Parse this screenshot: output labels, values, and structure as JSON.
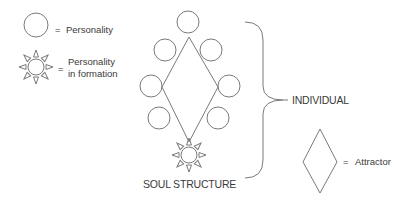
{
  "legend": {
    "personality": {
      "icon": "circle-icon",
      "equals": "=",
      "label": "Personality"
    },
    "personality_in_formation": {
      "icon": "sun-icon",
      "equals": "=",
      "label_line1": "Personality",
      "label_line2": "in formation"
    },
    "attractor": {
      "icon": "diamond-icon",
      "equals": "=",
      "label": "Attractor"
    }
  },
  "structure": {
    "title": "SOUL STRUCTURE",
    "personality_count": 7,
    "personality_in_formation_count": 1
  },
  "brace": {
    "label": "INDIVIDUAL"
  },
  "colors": {
    "stroke": "#7a7a7a",
    "text": "#3a3a3a",
    "background": "#ffffff"
  }
}
